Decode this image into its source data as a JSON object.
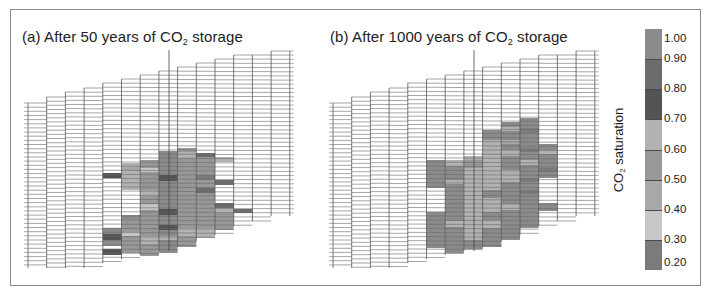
{
  "figure": {
    "panels": [
      {
        "id": "a",
        "title_prefix": "(a) After 50 years of CO",
        "title_sub": "2",
        "title_suffix": " storage"
      },
      {
        "id": "b",
        "title_prefix": "(b) After 1000 years of CO",
        "title_sub": "2",
        "title_suffix": " storage"
      }
    ],
    "colorbar": {
      "label_prefix": "CO",
      "label_sub": "2",
      "label_suffix": " saturation",
      "ticks": [
        "1.00",
        "0.90",
        "0.80",
        "0.70",
        "0.60",
        "0.50",
        "0.40",
        "0.30",
        "0.20"
      ]
    }
  },
  "chart_data": {
    "type": "heatmap",
    "colorbar_label": "CO2 saturation",
    "colorbar_range": [
      0.2,
      1.0
    ],
    "levels": [
      {
        "range": [
          0.2,
          0.3
        ],
        "color": "#7b7b7b"
      },
      {
        "range": [
          0.3,
          0.4
        ],
        "color": "#c7c7c7"
      },
      {
        "range": [
          0.4,
          0.5
        ],
        "color": "#a8a8a8"
      },
      {
        "range": [
          0.5,
          0.6
        ],
        "color": "#989898"
      },
      {
        "range": [
          0.6,
          0.7
        ],
        "color": "#b2b2b2"
      },
      {
        "range": [
          0.7,
          0.8
        ],
        "color": "#545454"
      },
      {
        "range": [
          0.8,
          0.9
        ],
        "color": "#6c6c6c"
      },
      {
        "range": [
          0.9,
          1.0
        ],
        "color": "#8b8b8b"
      }
    ],
    "grid": {
      "columns": 14,
      "column_width_px": 18.7,
      "row_spacing_px": 4.15,
      "column_tops_y": [
        103,
        97,
        92,
        88,
        83,
        79,
        75,
        71,
        67,
        63,
        59,
        55,
        55,
        51
      ],
      "column_bottoms_y": [
        268,
        268,
        268,
        268,
        263,
        259,
        255,
        251,
        247,
        241,
        235,
        226,
        221,
        216
      ],
      "well_column_index": 7
    },
    "panels": [
      {
        "id": "a",
        "label": "After 50 years of CO2 storage",
        "x0": 28,
        "well_x": 169,
        "cells": [
          {
            "col": 4,
            "y0": 173,
            "y1": 178,
            "level": 5
          },
          {
            "col": 4,
            "y0": 228,
            "y1": 234,
            "level": 7
          },
          {
            "col": 4,
            "y0": 234,
            "y1": 240,
            "level": 5
          },
          {
            "col": 4,
            "y0": 240,
            "y1": 246,
            "level": 7
          },
          {
            "col": 4,
            "y0": 249,
            "y1": 255,
            "level": 5
          },
          {
            "col": 5,
            "y0": 163,
            "y1": 190,
            "level": 4
          },
          {
            "col": 5,
            "y0": 167,
            "y1": 171,
            "level": 2
          },
          {
            "col": 5,
            "y0": 215,
            "y1": 219,
            "level": 7
          },
          {
            "col": 5,
            "y0": 219,
            "y1": 253,
            "level": 3
          },
          {
            "col": 5,
            "y0": 232,
            "y1": 236,
            "level": 1
          },
          {
            "col": 6,
            "y0": 160,
            "y1": 256,
            "level": 3
          },
          {
            "col": 6,
            "y0": 168,
            "y1": 172,
            "level": 1
          },
          {
            "col": 6,
            "y0": 190,
            "y1": 196,
            "level": 4
          },
          {
            "col": 6,
            "y0": 204,
            "y1": 210,
            "level": 1
          },
          {
            "col": 6,
            "y0": 236,
            "y1": 244,
            "level": 4
          },
          {
            "col": 7,
            "y0": 151,
            "y1": 253,
            "level": 7
          },
          {
            "col": 7,
            "y0": 175,
            "y1": 181,
            "level": 5
          },
          {
            "col": 7,
            "y0": 209,
            "y1": 215,
            "level": 5
          },
          {
            "col": 7,
            "y0": 225,
            "y1": 230,
            "level": 5
          },
          {
            "col": 7,
            "y0": 236,
            "y1": 240,
            "level": 4
          },
          {
            "col": 8,
            "y0": 148,
            "y1": 247,
            "level": 3
          },
          {
            "col": 8,
            "y0": 152,
            "y1": 158,
            "level": 4
          },
          {
            "col": 8,
            "y0": 228,
            "y1": 236,
            "level": 4
          },
          {
            "col": 9,
            "y0": 153,
            "y1": 238,
            "level": 3
          },
          {
            "col": 9,
            "y0": 153,
            "y1": 157,
            "level": 6
          },
          {
            "col": 9,
            "y0": 175,
            "y1": 180,
            "level": 0
          },
          {
            "col": 9,
            "y0": 188,
            "y1": 193,
            "level": 6
          },
          {
            "col": 9,
            "y0": 228,
            "y1": 238,
            "level": 4
          },
          {
            "col": 10,
            "y0": 157,
            "y1": 162,
            "level": 4
          },
          {
            "col": 10,
            "y0": 180,
            "y1": 185,
            "level": 6
          },
          {
            "col": 10,
            "y0": 203,
            "y1": 208,
            "level": 6
          },
          {
            "col": 10,
            "y0": 208,
            "y1": 230,
            "level": 3
          },
          {
            "col": 10,
            "y0": 208,
            "y1": 213,
            "level": 4
          },
          {
            "col": 11,
            "y0": 209,
            "y1": 213,
            "level": 6
          }
        ]
      },
      {
        "id": "b",
        "label": "After 1000 years of CO2 storage",
        "x0": 333,
        "well_x": 474,
        "cells": [
          {
            "col": 5,
            "y0": 160,
            "y1": 188,
            "level": 7
          },
          {
            "col": 5,
            "y0": 212,
            "y1": 248,
            "level": 7
          },
          {
            "col": 6,
            "y0": 160,
            "y1": 253,
            "level": 7
          },
          {
            "col": 6,
            "y0": 160,
            "y1": 166,
            "level": 4
          },
          {
            "col": 6,
            "y0": 180,
            "y1": 184,
            "level": 4
          },
          {
            "col": 6,
            "y0": 221,
            "y1": 227,
            "level": 4
          },
          {
            "col": 7,
            "y0": 156,
            "y1": 249,
            "level": 4
          },
          {
            "col": 7,
            "y0": 160,
            "y1": 168,
            "level": 3
          },
          {
            "col": 7,
            "y0": 240,
            "y1": 249,
            "level": 7
          },
          {
            "col": 8,
            "y0": 130,
            "y1": 247,
            "level": 4
          },
          {
            "col": 8,
            "y0": 130,
            "y1": 140,
            "level": 7
          },
          {
            "col": 8,
            "y0": 190,
            "y1": 198,
            "level": 7
          },
          {
            "col": 8,
            "y0": 212,
            "y1": 220,
            "level": 7
          },
          {
            "col": 8,
            "y0": 228,
            "y1": 247,
            "level": 7
          },
          {
            "col": 9,
            "y0": 122,
            "y1": 240,
            "level": 7
          },
          {
            "col": 9,
            "y0": 127,
            "y1": 131,
            "level": 4
          },
          {
            "col": 9,
            "y0": 140,
            "y1": 144,
            "level": 2
          },
          {
            "col": 9,
            "y0": 150,
            "y1": 156,
            "level": 4
          },
          {
            "col": 9,
            "y0": 170,
            "y1": 182,
            "level": 4
          },
          {
            "col": 9,
            "y0": 204,
            "y1": 210,
            "level": 4
          },
          {
            "col": 10,
            "y0": 118,
            "y1": 228,
            "level": 7
          },
          {
            "col": 10,
            "y0": 128,
            "y1": 133,
            "level": 0
          },
          {
            "col": 10,
            "y0": 148,
            "y1": 152,
            "level": 0
          },
          {
            "col": 10,
            "y0": 160,
            "y1": 165,
            "level": 4
          },
          {
            "col": 10,
            "y0": 178,
            "y1": 182,
            "level": 0
          },
          {
            "col": 10,
            "y0": 190,
            "y1": 194,
            "level": 0
          },
          {
            "col": 11,
            "y0": 144,
            "y1": 178,
            "level": 7
          },
          {
            "col": 11,
            "y0": 150,
            "y1": 154,
            "level": 4
          },
          {
            "col": 11,
            "y0": 168,
            "y1": 172,
            "level": 0
          },
          {
            "col": 11,
            "y0": 203,
            "y1": 211,
            "level": 7
          }
        ]
      }
    ]
  }
}
